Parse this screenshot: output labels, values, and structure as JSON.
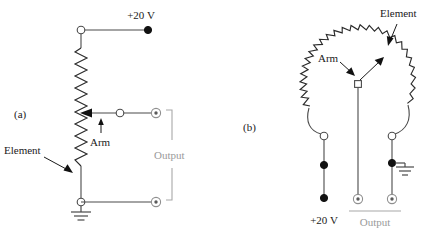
{
  "figure": {
    "background_color": "#ffffff",
    "line_color": "#2b2b2b",
    "gray_color": "#9a9a9a"
  },
  "panel_a": {
    "panel_label": "(a)",
    "supply_label": "+20 V",
    "element_label": "Element",
    "arm_label": "Arm",
    "output_label": "Output",
    "description": "Linear potentiometer drawn as a vertical resistive element with a horizontal wiper arm; top end to +20 V, bottom end to ground, output taken between arm and ground."
  },
  "panel_b": {
    "panel_label": "(b)",
    "supply_label": "+20 V",
    "element_label": "Element",
    "arm_label": "Arm",
    "output_label": "Output",
    "description": "Rotary potentiometer drawn as a circular resistive arc with a pivoting arm; left end to +20 V, right end to ground, output taken between arm and ground."
  },
  "symbols": {
    "open_node": "open-circle-terminal",
    "filled_node": "filled-dot-terminal",
    "output_jack": "coaxial-output-terminal",
    "ground": "ground-symbol",
    "resistor": "zigzag-resistive-element",
    "wiper_arrow": "arrowhead-wiper-contact"
  }
}
